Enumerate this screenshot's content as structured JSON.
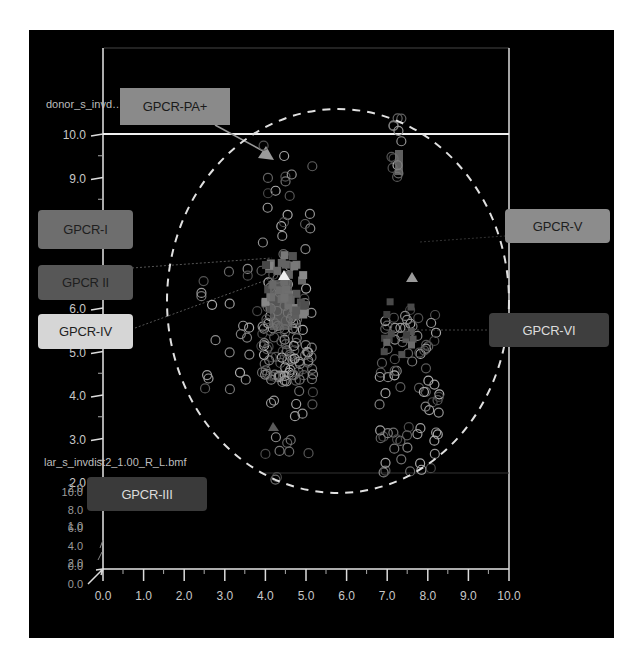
{
  "chart_data": {
    "type": "scatter",
    "title": "",
    "series_labels": {
      "top": "donor_s_invd…f",
      "bottom": "lar_s_invdist2_1.00_R_L.bmf"
    },
    "xlabel": "",
    "ylabel": "",
    "x_ticks": [
      "0.0",
      "1.0",
      "2.0",
      "3.0",
      "4.0",
      "5.0",
      "6.0",
      "7.0",
      "8.0",
      "9.0",
      "10.0"
    ],
    "y_ticks": [
      "2.0",
      "3.0",
      "4.0",
      "5.0",
      "6.0",
      "9.0",
      "10.0"
    ],
    "secondary_y_ticks": [
      "10.0",
      "2.0",
      "8.0",
      "6.0",
      "1.0",
      "4.0",
      "2.0",
      "0.0",
      "0.0"
    ],
    "xlim": [
      0,
      10
    ],
    "ylim": [
      0,
      10
    ],
    "grid": false,
    "annotations": [
      {
        "label": "GPCR-PA+",
        "points_to": [
          4.2,
          9.5
        ],
        "marker": "triangle"
      },
      {
        "label": "GPCR-I",
        "points_to": null
      },
      {
        "label": "GPCR II",
        "points_to": [
          4.3,
          6.8
        ]
      },
      {
        "label": "GPCR-IV",
        "points_to": [
          4.3,
          6.3
        ]
      },
      {
        "label": "GPCR-V",
        "points_to": [
          7.5,
          6.7
        ],
        "marker": "triangle"
      },
      {
        "label": "GPCR-VI",
        "points_to": [
          7.4,
          5.5
        ]
      },
      {
        "label": "GPCR-III",
        "points_to": [
          4.1,
          3.0
        ],
        "marker": "triangle"
      }
    ],
    "clusters": [
      {
        "name": "cluster-left",
        "x_range": [
          3.9,
          5.2
        ],
        "y_range": [
          2.0,
          9.8
        ],
        "marker": "open-circle"
      },
      {
        "name": "cluster-left-squares",
        "x_range": [
          4.0,
          5.0
        ],
        "y_range": [
          5.8,
          7.3
        ],
        "marker": "square"
      },
      {
        "name": "cluster-right",
        "x_range": [
          6.8,
          8.3
        ],
        "y_range": [
          2.2,
          6.0
        ],
        "marker": "open-circle"
      },
      {
        "name": "cluster-top-right",
        "x_range": [
          7.1,
          7.4
        ],
        "y_range": [
          9.0,
          10.4
        ],
        "marker": "open-circle"
      },
      {
        "name": "scatter-left",
        "x_range": [
          2.4,
          3.9
        ],
        "y_range": [
          3.8,
          7.0
        ],
        "marker": "open-circle"
      }
    ],
    "overlay": {
      "shape": "dashed-ellipse",
      "center": [
        5.8,
        6.1
      ],
      "rx": 4.2,
      "ry": 4.4
    },
    "reference_line_y": 10.0
  },
  "labels": {
    "gpcr_pa": "GPCR-PA+",
    "gpcr_i": "GPCR-I",
    "gpcr_ii": "GPCR II",
    "gpcr_iv": "GPCR-IV",
    "gpcr_v": "GPCR-V",
    "gpcr_vi": "GPCR-VI",
    "gpcr_iii": "GPCR-III"
  },
  "colors": {
    "background": "#000000",
    "axis": "#e0e0e0",
    "gpcr_pa": "#8a8a8a",
    "gpcr_i": "#6e6e6e",
    "gpcr_ii": "#575757",
    "gpcr_iv": "#d6d6d6",
    "gpcr_v": "#8c8c8c",
    "gpcr_vi": "#3e3e3e",
    "gpcr_iii": "#3a3a3a"
  }
}
